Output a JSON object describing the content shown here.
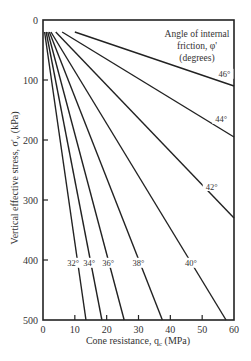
{
  "chart_data": {
    "type": "line",
    "title": "",
    "xlabel": "Cone resistance, q_c (MPa)",
    "ylabel": "Vertical effective stress, σ'_v (kPa)",
    "xlim": [
      0,
      60
    ],
    "ylim": [
      0,
      500
    ],
    "y_inverted": true,
    "x_ticks": [
      0,
      10,
      20,
      30,
      40,
      50,
      60
    ],
    "y_ticks": [
      0,
      100,
      200,
      300,
      400,
      500
    ],
    "grid": false,
    "legend_title": "Angle of internal friction, φ' (degrees)",
    "series": [
      {
        "name": "32°",
        "label": "32°",
        "points": [
          [
            0.5,
            20
          ],
          [
            13.5,
            500
          ]
        ],
        "label_at": [
          9.5,
          408
        ]
      },
      {
        "name": "34°",
        "label": "34°",
        "points": [
          [
            1.0,
            20
          ],
          [
            18.5,
            500
          ]
        ],
        "label_at": [
          14.5,
          408
        ]
      },
      {
        "name": "36°",
        "label": "36°",
        "points": [
          [
            1.5,
            20
          ],
          [
            25.5,
            500
          ]
        ],
        "label_at": [
          20.5,
          408
        ]
      },
      {
        "name": "38°",
        "label": "38°",
        "points": [
          [
            2.0,
            20
          ],
          [
            37.5,
            500
          ]
        ],
        "label_at": [
          30.0,
          408
        ]
      },
      {
        "name": "40°",
        "label": "40°",
        "points": [
          [
            2.5,
            20
          ],
          [
            57.5,
            500
          ]
        ],
        "label_at": [
          46.5,
          408
        ]
      },
      {
        "name": "42°",
        "label": "42°",
        "points": [
          [
            4.0,
            20
          ],
          [
            60,
            330
          ]
        ],
        "label_at": [
          53.0,
          280
        ]
      },
      {
        "name": "44°",
        "label": "44°",
        "points": [
          [
            6.0,
            20
          ],
          [
            60,
            195
          ]
        ],
        "label_at": [
          56.0,
          168
        ]
      },
      {
        "name": "46°",
        "label": "46°",
        "points": [
          [
            10.0,
            20
          ],
          [
            60,
            110
          ]
        ],
        "label_at": [
          57.0,
          93
        ]
      }
    ]
  },
  "labels": {
    "legend_line1": "Angle of internal",
    "legend_line2": "friction, φ'",
    "legend_line3": "(degrees)",
    "xlabel": "Cone resistance, q",
    "xlabel_sub": "c",
    "xlabel_unit": " (MPa)",
    "ylabel": "Vertical effective stress, σ'",
    "ylabel_sub": "v",
    "ylabel_unit": " (kPa)"
  }
}
